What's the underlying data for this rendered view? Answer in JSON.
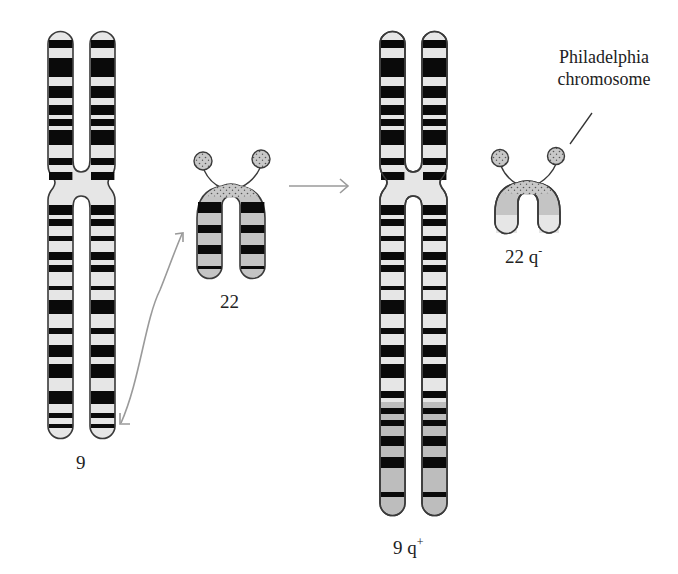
{
  "labels": {
    "chr9": "9",
    "chr22": "22",
    "chr9q_plus_base": "9 q",
    "chr9q_plus_sup": "+",
    "chr22q_minus_base": "22 q",
    "chr22q_minus_sup": "-",
    "philadelphia_line1": "Philadelphia",
    "philadelphia_line2": "chromosome"
  },
  "colors": {
    "outline": "#3a3a3a",
    "dark_band": "#0a0a0a",
    "light_band": "#e6e6e6",
    "translocated_region": "#bdbdbd",
    "arrow": "#9a9a9a"
  },
  "diagram": {
    "chr9_p_bands": [
      [
        40,
        48
      ],
      [
        58,
        77
      ],
      [
        86,
        98
      ],
      [
        105,
        115
      ],
      [
        119,
        126
      ],
      [
        130,
        145
      ],
      [
        158,
        165
      ],
      [
        172,
        180
      ]
    ],
    "chr9_q_bands": [
      [
        205,
        215
      ],
      [
        219,
        226
      ],
      [
        236,
        241
      ],
      [
        252,
        260
      ],
      [
        265,
        272
      ],
      [
        286,
        290
      ],
      [
        300,
        314
      ],
      [
        328,
        334
      ],
      [
        345,
        357
      ],
      [
        364,
        378
      ],
      [
        391,
        404
      ],
      [
        413,
        418
      ],
      [
        424,
        428
      ]
    ],
    "chr9qplus_q_bands": [
      [
        205,
        215
      ],
      [
        219,
        226
      ],
      [
        236,
        241
      ],
      [
        252,
        260
      ],
      [
        265,
        272
      ],
      [
        286,
        290
      ],
      [
        300,
        314
      ],
      [
        328,
        334
      ],
      [
        345,
        357
      ],
      [
        364,
        378
      ],
      [
        391,
        398
      ],
      [
        408,
        414
      ],
      [
        420,
        426
      ],
      [
        436,
        446
      ],
      [
        457,
        468
      ],
      [
        492,
        497
      ]
    ],
    "chr9qplus_translocated_start": 402,
    "chr22_bands": [
      [
        202,
        213
      ],
      [
        225,
        233
      ],
      [
        245,
        254
      ],
      [
        266,
        269
      ]
    ]
  }
}
